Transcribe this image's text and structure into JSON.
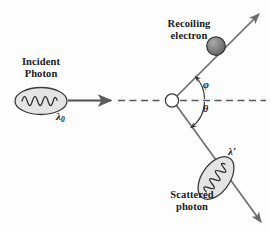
{
  "figure": {
    "background_color": "#fdfdfd",
    "ink_color": "#333333",
    "labels": {
      "incident_photon": "Incident\nPhoton",
      "incident_photon_line1": "Incident",
      "incident_photon_line2": "Photon",
      "recoiling_electron_line1": "Recoiling",
      "recoiling_electron_line2": "electron",
      "scattered_photon_line1": "Scattered",
      "scattered_photon_line2": "photon",
      "lambda_initial": "λ",
      "lambda_initial_subscript": "0",
      "lambda_final": "λ′",
      "angle_phi": "φ",
      "angle_theta": "θ"
    },
    "elements": {
      "incident_photon_blob": {
        "name": "incident-photon-ellipse",
        "fill": "#e3e3e3",
        "stroke": "#3a3a3a",
        "cx": 41,
        "cy": 101,
        "rx": 26,
        "ry": 13,
        "rotation": 0
      },
      "scattered_photon_blob": {
        "name": "scattered-photon-ellipse",
        "fill": "#e3e3e3",
        "stroke": "#3a3a3a",
        "cx": 216,
        "cy": 178,
        "rx": 24,
        "ry": 14,
        "rotation": -55
      },
      "electron_sphere": {
        "name": "recoiling-electron-sphere",
        "fill": "#7d7d7d",
        "stroke": "#2e2e2e",
        "cx": 216,
        "cy": 46,
        "r": 9
      },
      "scattering_vertex": {
        "name": "scattering-vertex",
        "fill": "#ffffff",
        "stroke": "#3a3a3a",
        "cx": 172,
        "cy": 100,
        "r": 6.5
      },
      "incident_arrow": {
        "name": "incident-photon-arrow",
        "x1": 68,
        "y1": 100,
        "x2": 112,
        "y2": 100,
        "style": "solid",
        "color": "#4a4a4a"
      },
      "axis_dashed_left": {
        "name": "incident-axis-dashed",
        "x1": 113,
        "y1": 100,
        "x2": 165,
        "y2": 100,
        "style": "dashed",
        "color": "#555555"
      },
      "axis_dashed_right": {
        "name": "reference-axis-dashed",
        "x1": 179,
        "y1": 100,
        "x2": 266,
        "y2": 100,
        "style": "dashed",
        "color": "#555555"
      },
      "electron_track": {
        "name": "recoiling-electron-arrow",
        "x1": 176,
        "y1": 96,
        "x2": 262,
        "y2": 12,
        "style": "solid",
        "color": "#6a6a6a"
      },
      "scattered_track": {
        "name": "scattered-photon-arrow",
        "x1": 176,
        "y1": 105,
        "x2": 264,
        "y2": 226,
        "style": "solid",
        "color": "#6a6a6a"
      },
      "phi_arc": {
        "name": "angle-phi-arc",
        "center_x": 172,
        "center_y": 100,
        "radius": 32,
        "start_angle_deg": 0,
        "end_angle_deg": 44,
        "label": "φ"
      },
      "theta_arc": {
        "name": "angle-theta-arc",
        "center_x": 172,
        "center_y": 100,
        "radius": 32,
        "start_angle_deg": 0,
        "end_angle_deg": -54,
        "label": "θ"
      }
    }
  }
}
